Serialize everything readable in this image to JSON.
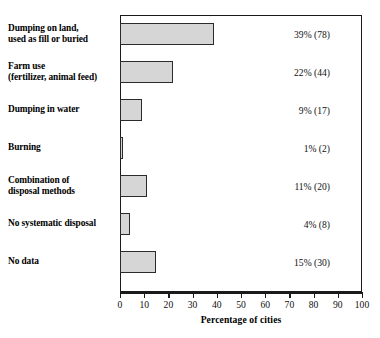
{
  "chart_data": {
    "type": "bar",
    "orientation": "horizontal",
    "title": "",
    "xlabel": "Percentage of cities",
    "ylabel": "",
    "xlim": [
      0,
      100
    ],
    "xticks": [
      0,
      10,
      20,
      30,
      40,
      50,
      60,
      70,
      80,
      90,
      100
    ],
    "grid": false,
    "legend": null,
    "categories": [
      "Dumping on land, used as fill or buried",
      "Farm use (fertilizer, animal feed)",
      "Dumping in water",
      "Burning",
      "Combination of disposal methods",
      "No systematic disposal",
      "No data"
    ],
    "values": [
      39,
      22,
      9,
      1,
      11,
      4,
      15
    ],
    "counts": [
      78,
      44,
      17,
      2,
      20,
      8,
      30
    ],
    "data_labels": [
      "39% (78)",
      "22% (44)",
      "9% (17)",
      "1% (2)",
      "11% (20)",
      "4% (8)",
      "15% (30)"
    ],
    "colors": {
      "bar_fill": "#d6d6d6",
      "bar_stroke": "#2b2b2b",
      "axis": "#1a1a1a",
      "text": "#111111",
      "background": "#ffffff"
    }
  },
  "rows": [
    {
      "label_line1": "Dumping on land,",
      "label_line2": "used as fill or buried",
      "value_label": "39% (78)",
      "percent": 39
    },
    {
      "label_line1": "Farm use",
      "label_line2": "(fertilizer, animal feed)",
      "value_label": "22% (44)",
      "percent": 22
    },
    {
      "label_line1": "Dumping in water",
      "label_line2": "",
      "value_label": "9% (17)",
      "percent": 9
    },
    {
      "label_line1": "Burning",
      "label_line2": "",
      "value_label": "1% (2)",
      "percent": 1
    },
    {
      "label_line1": "Combination of",
      "label_line2": "disposal methods",
      "value_label": "11% (20)",
      "percent": 11
    },
    {
      "label_line1": "No systematic disposal",
      "label_line2": "",
      "value_label": "4% (8)",
      "percent": 4
    },
    {
      "label_line1": "No data",
      "label_line2": "",
      "value_label": "15% (30)",
      "percent": 15
    }
  ],
  "axis": {
    "title": "Percentage of cities",
    "ticks": [
      "0",
      "10",
      "20",
      "30",
      "40",
      "50",
      "60",
      "70",
      "80",
      "90",
      "100"
    ]
  }
}
